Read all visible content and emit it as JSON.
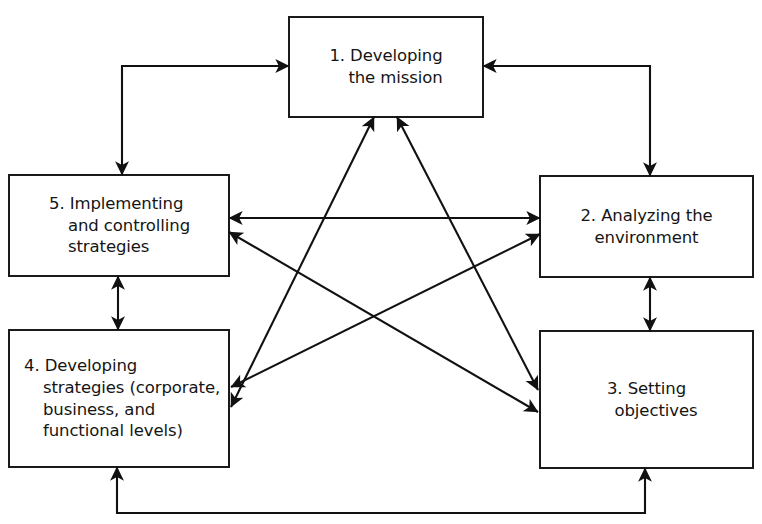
{
  "diagram": {
    "type": "process-cycle",
    "title_visible": false,
    "canvas": {
      "width": 762,
      "height": 524,
      "background": "#ffffff"
    },
    "style": {
      "line_color": "#111111",
      "box_fill": "#ffffff",
      "box_stroke": "#1a1a1a",
      "text_color": "#151515"
    },
    "nodes": [
      {
        "id": "node-1",
        "number": "1.",
        "name": "developing-the-mission",
        "align": "center",
        "lines": [
          "1. Developing",
          "the mission"
        ],
        "indents": [
          0,
          1
        ],
        "rect": {
          "x": 289,
          "y": 17,
          "w": 194,
          "h": 100
        }
      },
      {
        "id": "node-2",
        "number": "2.",
        "name": "analyzing-the-environment",
        "align": "center",
        "lines": [
          "2. Analyzing the",
          "environment"
        ],
        "indents": [
          0,
          0
        ],
        "rect": {
          "x": 540,
          "y": 176,
          "w": 213,
          "h": 101
        }
      },
      {
        "id": "node-3",
        "number": "3.",
        "name": "setting-objectives",
        "align": "center",
        "lines": [
          "3. Setting",
          "objectives"
        ],
        "indents": [
          0,
          1
        ],
        "rect": {
          "x": 540,
          "y": 331,
          "w": 213,
          "h": 137
        }
      },
      {
        "id": "node-4",
        "number": "4.",
        "name": "developing-strategies",
        "align": "left",
        "lines": [
          "4. Developing",
          "strategies (corporate,",
          "business, and",
          "functional levels)"
        ],
        "indents": [
          0,
          1,
          1,
          1
        ],
        "rect": {
          "x": 9,
          "y": 330,
          "w": 220,
          "h": 137
        }
      },
      {
        "id": "node-5",
        "number": "5.",
        "name": "implementing-and-controlling-strategies",
        "align": "left",
        "lines": [
          "5. Implementing",
          "and controlling",
          "strategies"
        ],
        "indents": [
          0,
          1,
          1
        ],
        "rect": {
          "x": 9,
          "y": 175,
          "w": 220,
          "h": 101
        }
      }
    ],
    "connectors": [
      {
        "id": "conn-5-1",
        "name": "connector-implementing-to-mission",
        "from": "node-5",
        "to": "node-1",
        "kind": "elbow",
        "heads": "both"
      },
      {
        "id": "conn-1-2",
        "name": "connector-mission-to-analyzing",
        "from": "node-1",
        "to": "node-2",
        "kind": "elbow",
        "heads": "both"
      },
      {
        "id": "conn-2-3",
        "name": "connector-analyzing-to-objectives",
        "from": "node-2",
        "to": "node-3",
        "kind": "straight-vertical",
        "heads": "both"
      },
      {
        "id": "conn-5-4",
        "name": "connector-implementing-to-developing",
        "from": "node-5",
        "to": "node-4",
        "kind": "straight-vertical",
        "heads": "both"
      },
      {
        "id": "conn-4-3",
        "name": "connector-developing-to-objectives",
        "from": "node-4",
        "to": "node-3",
        "kind": "elbow",
        "heads": "both"
      },
      {
        "id": "conn-5-2",
        "name": "connector-implementing-to-analyzing",
        "from": "node-5",
        "to": "node-2",
        "kind": "straight-horizontal",
        "heads": "both"
      },
      {
        "id": "conn-1-4",
        "name": "connector-mission-to-developing",
        "from": "node-1",
        "to": "node-4",
        "kind": "diagonal",
        "heads": "both"
      },
      {
        "id": "conn-1-3",
        "name": "connector-mission-to-objectives",
        "from": "node-1",
        "to": "node-3",
        "kind": "diagonal",
        "heads": "both"
      },
      {
        "id": "conn-5-3",
        "name": "connector-implementing-to-objectives",
        "from": "node-5",
        "to": "node-3",
        "kind": "diagonal",
        "heads": "both"
      },
      {
        "id": "conn-4-2",
        "name": "connector-developing-to-analyzing",
        "from": "node-4",
        "to": "node-2",
        "kind": "diagonal",
        "heads": "both"
      }
    ]
  }
}
